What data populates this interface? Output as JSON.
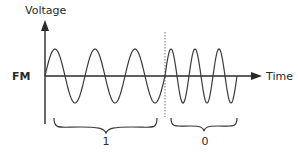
{
  "diagram": {
    "type": "fm-modulation",
    "y_axis_label": "Voltage",
    "x_axis_label": "Time",
    "signal_label": "FM",
    "segments": [
      {
        "bit_label": "1",
        "cycles": 3,
        "frequency": "low"
      },
      {
        "bit_label": "0",
        "cycles": 3,
        "frequency": "high"
      }
    ],
    "colors": {
      "stroke": "#3a3a3a",
      "text": "#2a2a2a",
      "divider": "#777777"
    }
  }
}
